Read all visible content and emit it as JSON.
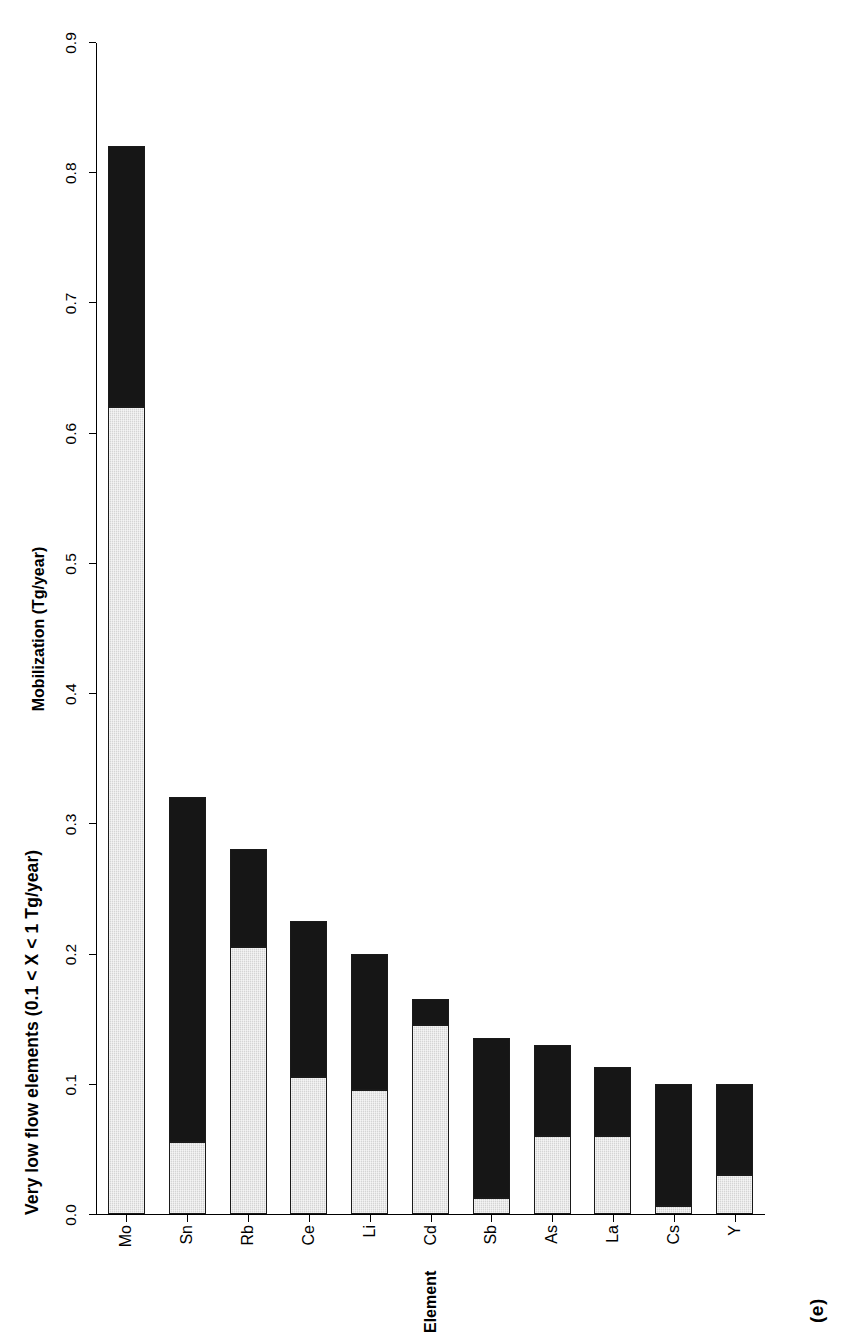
{
  "panel_label": "(e)",
  "chart_data": {
    "type": "bar",
    "orientation": "vertical-stacked",
    "title": "Very low flow elements (0.1 < X < 1 Tg/year)",
    "xlabel": "Element",
    "ylabel": "Mobilization (Tg/year)",
    "ylim": [
      0.0,
      0.9
    ],
    "ytick_labels": [
      "0.0",
      "0.1",
      "0.2",
      "0.3",
      "0.4",
      "0.5",
      "0.6",
      "0.7",
      "0.8",
      "0.9"
    ],
    "ytick_values": [
      0.0,
      0.1,
      0.2,
      0.3,
      0.4,
      0.5,
      0.6,
      0.7,
      0.8,
      0.9
    ],
    "grid": false,
    "legend": null,
    "categories": [
      "Mo",
      "Sn",
      "Rb",
      "Ce",
      "Li",
      "Cd",
      "Sb",
      "As",
      "La",
      "Cs",
      "Y"
    ],
    "series": [
      {
        "name": "natural",
        "fill": "light-grey-stipple",
        "values": [
          0.62,
          0.055,
          0.205,
          0.105,
          0.095,
          0.145,
          0.012,
          0.06,
          0.06,
          0.006,
          0.03
        ]
      },
      {
        "name": "anthropogenic",
        "fill": "solid-black",
        "values": [
          0.2,
          0.265,
          0.075,
          0.12,
          0.105,
          0.02,
          0.123,
          0.07,
          0.053,
          0.094,
          0.07
        ]
      }
    ],
    "totals": [
      0.82,
      0.32,
      0.28,
      0.225,
      0.2,
      0.165,
      0.135,
      0.13,
      0.113,
      0.1,
      0.1
    ],
    "colors": {
      "natural": "#d4d4d4",
      "anthropogenic": "#161616",
      "axis": "#000000",
      "background": "#ffffff"
    }
  }
}
